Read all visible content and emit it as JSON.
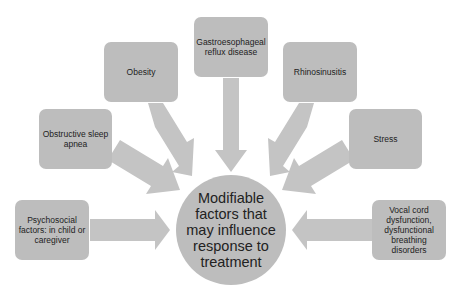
{
  "diagram": {
    "title": "Modifiable factors that may influence response to treatment",
    "center": {
      "label": "Modifiable factors that may influence response to treatment",
      "lines": [
        "Modifiable",
        "factors that",
        "may influence",
        "response to",
        "treatment"
      ]
    },
    "factors": [
      {
        "id": "psychosocial",
        "label": "Psychosocial factors: in child or caregiver"
      },
      {
        "id": "obstructive-sleep-apnea",
        "label": "Obstructive sleep apnea"
      },
      {
        "id": "obesity",
        "label": "Obesity"
      },
      {
        "id": "gerd",
        "label": "Gastroesophageal reflux disease"
      },
      {
        "id": "rhinosinusitis",
        "label": "Rhinosinusitis"
      },
      {
        "id": "stress",
        "label": "Stress"
      },
      {
        "id": "vocal-cord",
        "label": "Vocal cord dysfunction, dysfunctional breathing disorders"
      }
    ],
    "colors": {
      "shape_fill": "#bdbdbd",
      "arrow_fill": "#c4c4c4",
      "text": "#222222",
      "background": "#ffffff"
    }
  }
}
